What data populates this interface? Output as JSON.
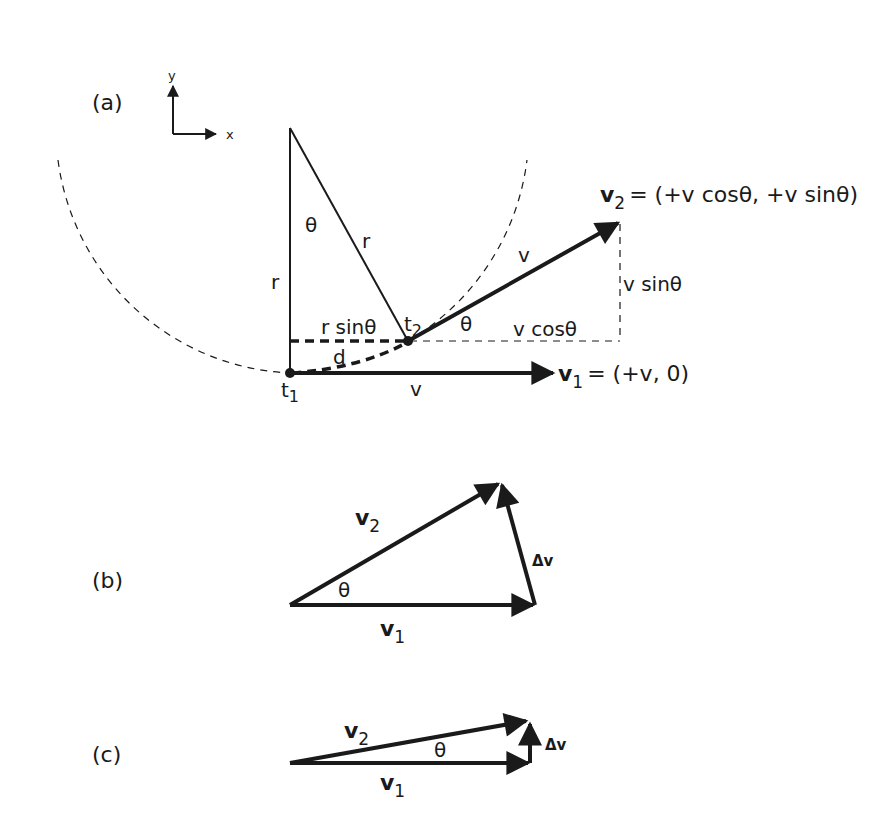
{
  "panels": {
    "a": {
      "label": "(a)",
      "axes": {
        "y": "y",
        "x": "x"
      },
      "labels": {
        "theta_top": "θ",
        "r_vertical": "r",
        "r_slant": "r",
        "t2": "t",
        "t2_sub": "2",
        "t1": "t",
        "t1_sub": "1",
        "rsin": "r sinθ",
        "d": "d",
        "v_bottom": "v",
        "v_slant": "v",
        "theta_v2": "θ",
        "vcos": "v cosθ",
        "vsin": "v sinθ",
        "v2_name": "v",
        "v2_sub": "2",
        "v2_eq": "= (+v cosθ, +v sinθ)",
        "v1_name": "v",
        "v1_sub": "1",
        "v1_eq": "= (+v, 0)"
      }
    },
    "b": {
      "label": "(b)",
      "labels": {
        "v2_name": "v",
        "v2_sub": "2",
        "v1_name": "v",
        "v1_sub": "1",
        "theta": "θ",
        "dv": "Δv"
      }
    },
    "c": {
      "label": "(c)",
      "labels": {
        "v2_name": "v",
        "v2_sub": "2",
        "v1_name": "v",
        "v1_sub": "1",
        "theta": "θ",
        "dv": "Δv"
      }
    }
  },
  "colors": {
    "ink": "#1a1a1a",
    "background": "#ffffff"
  }
}
